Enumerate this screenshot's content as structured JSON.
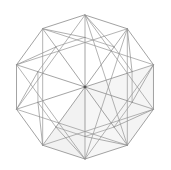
{
  "figure": {
    "title": "Decagon rhombic dissection",
    "shape_type": "regular-decagon",
    "sides": 10,
    "background_color": "#ffffff",
    "line_color": "#808080",
    "line_color_secondary": "#9a9a9a",
    "line_width": 0.7,
    "shaded_fill_color": "#f2f2f2",
    "center": {
      "x": 85.0,
      "y": 87.0
    },
    "outer_radius": 72.0,
    "inner_radius": 49.5,
    "outer_start_angle_deg": -90,
    "canvas": {
      "width": 171,
      "height": 170
    }
  },
  "geometry": {
    "outer_vertices": [
      {
        "index": 0,
        "x": 85.0,
        "y": 15.0
      },
      {
        "index": 1,
        "x": 127.3,
        "y": 28.7
      },
      {
        "index": 2,
        "x": 153.5,
        "y": 64.8
      },
      {
        "index": 3,
        "x": 153.5,
        "y": 109.2
      },
      {
        "index": 4,
        "x": 127.3,
        "y": 145.3
      },
      {
        "index": 5,
        "x": 85.0,
        "y": 159.0
      },
      {
        "index": 6,
        "x": 42.7,
        "y": 145.3
      },
      {
        "index": 7,
        "x": 16.5,
        "y": 109.2
      },
      {
        "index": 8,
        "x": 16.5,
        "y": 64.8
      },
      {
        "index": 9,
        "x": 42.7,
        "y": 28.7
      }
    ],
    "inner_vertices": [
      {
        "index": 0,
        "x": 114.1,
        "y": 27.0
      },
      {
        "index": 1,
        "x": 132.1,
        "y": 71.7
      },
      {
        "index": 2,
        "x": 114.1,
        "y": 116.4
      },
      {
        "index": 3,
        "x": 70.6,
        "y": 136.2
      },
      {
        "index": 4,
        "x": 29.0,
        "y": 114.2
      },
      {
        "index": 5,
        "x": 37.9,
        "y": 71.7
      },
      {
        "index": 6,
        "x": 55.9,
        "y": 27.0
      },
      {
        "index": 7,
        "x": 85.0,
        "y": 37.5
      },
      {
        "index": 8,
        "x": 37.9,
        "y": 102.3
      },
      {
        "index": 9,
        "x": 132.1,
        "y": 102.3
      }
    ],
    "radial_spoke_count": 10,
    "shaded_regions": [
      {
        "name": "lower-right-rhombus",
        "fill": "#f2f2f2"
      },
      {
        "name": "lower-center-rhombus",
        "fill": "#f6f6f6"
      },
      {
        "name": "right-lower-band",
        "fill": "#f7f7f7"
      }
    ]
  },
  "chart_data": {
    "type": "diagram",
    "title": "Decagon rhombic dissection",
    "polygon_sides": 10,
    "center": [
      85.0,
      87.0
    ],
    "outer_radius": 72.0,
    "inner_radius": 49.5,
    "rhombus_count": 25,
    "grid": false,
    "legend": false,
    "xlabel": "",
    "ylabel": "",
    "xlim": [
      0,
      171
    ],
    "ylim": [
      0,
      170
    ]
  }
}
